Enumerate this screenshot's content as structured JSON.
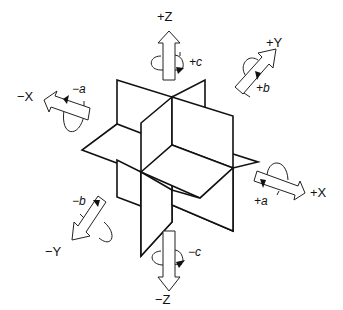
{
  "figure": {
    "stroke_color": "#111111",
    "background": "#ffffff"
  },
  "axes": {
    "plus_z": {
      "axis_label": "+Z",
      "rotation_label": "+c"
    },
    "minus_z": {
      "axis_label": "−Z",
      "rotation_label": "−c"
    },
    "plus_y": {
      "axis_label": "+Y",
      "rotation_label": "+b"
    },
    "minus_y": {
      "axis_label": "−Y",
      "rotation_label": "−b"
    },
    "plus_x": {
      "axis_label": "+X",
      "rotation_label": "+a"
    },
    "minus_x": {
      "axis_label": "−X",
      "rotation_label": "−a"
    }
  }
}
